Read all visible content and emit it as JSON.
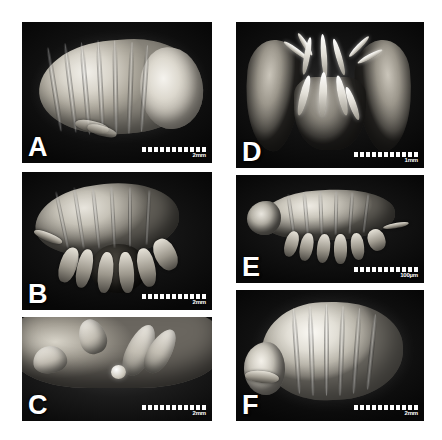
{
  "figure": {
    "type": "sem-micrograph-plate",
    "background_color": "#ffffff",
    "panel_background_color": "#000000",
    "label_color": "#ffffff",
    "panel_count": 6,
    "columns": 2,
    "rows": 3
  },
  "panels": [
    {
      "id": "panel-a",
      "letter": "A",
      "column": "left",
      "row": 1,
      "scalebar": {
        "label": "2mm",
        "ticks": 11
      },
      "subject": "whole specimen, dorsolateral view"
    },
    {
      "id": "panel-b",
      "letter": "B",
      "column": "left",
      "row": 2,
      "scalebar": {
        "label": "2mm",
        "ticks": 11
      },
      "subject": "whole specimen, lateral view with pereopods"
    },
    {
      "id": "panel-c",
      "letter": "C",
      "column": "left",
      "row": 3,
      "scalebar": {
        "label": "2mm",
        "ticks": 11
      },
      "subject": "close-up of appendage and tissue surface"
    },
    {
      "id": "panel-d",
      "letter": "D",
      "column": "right",
      "row": 1,
      "scalebar": {
        "label": "1mm",
        "ticks": 11
      },
      "subject": "frontal view of mouthparts between paired lobes"
    },
    {
      "id": "panel-e",
      "letter": "E",
      "column": "right",
      "row": 2,
      "scalebar": {
        "label": "100µm",
        "ticks": 11
      },
      "subject": "juvenile specimen, lateral view"
    },
    {
      "id": "panel-f",
      "letter": "F",
      "column": "right",
      "row": 3,
      "scalebar": {
        "label": "2mm",
        "ticks": 11
      },
      "subject": "whole specimen, dorsal view"
    }
  ]
}
